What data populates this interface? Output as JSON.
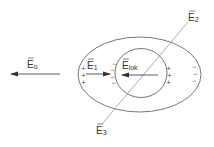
{
  "diagram": {
    "title": "",
    "field_labels": {
      "E0": {
        "base": "E",
        "sub": "o"
      },
      "E1": {
        "base": "E",
        "sub": "1"
      },
      "Elok": {
        "base": "E",
        "sub": "lok"
      },
      "E2": {
        "base": "E",
        "sub": "2"
      },
      "E3": {
        "base": "E",
        "sub": "3"
      }
    },
    "charges": {
      "outer_left": [
        "+",
        "+",
        "+"
      ],
      "inner_left": [
        "−",
        "−",
        "−",
        "−"
      ],
      "inner_right": [
        "+",
        "+",
        "+"
      ],
      "outer_right": [
        "−",
        "−",
        "−"
      ]
    },
    "colors": {
      "stroke": "#555555",
      "text": "#333333",
      "background": "#ffffff"
    }
  }
}
